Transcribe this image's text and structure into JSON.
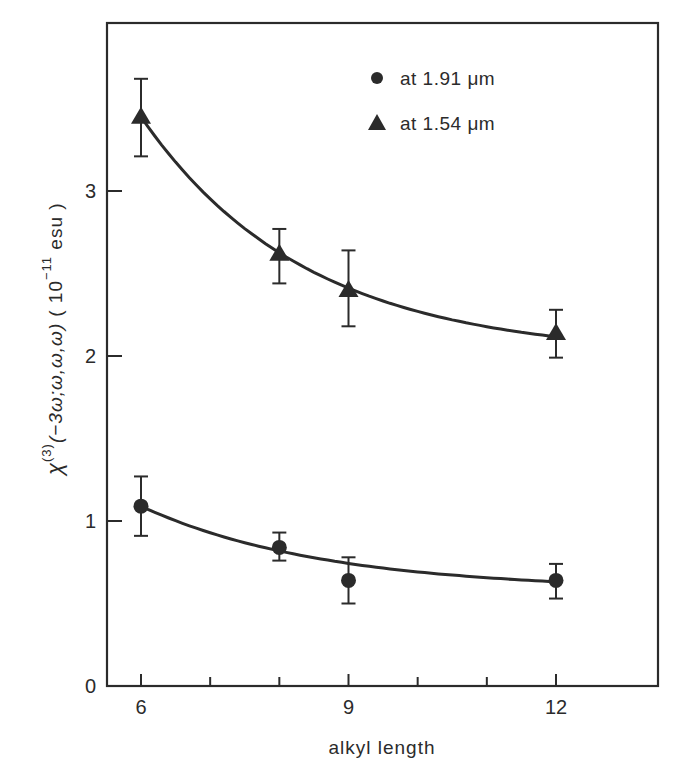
{
  "chart_data": {
    "type": "scatter",
    "title": "",
    "xlabel": "alkyl length",
    "ylabel": "χ(3)(−3ω;ω,ω,ω) (10⁻¹¹ esu)",
    "ylabel_parts": {
      "symbol": "χ",
      "superscript": "(3)",
      "arguments": "(−3ω;ω,ω,ω)",
      "unit_open": "( 10",
      "unit_exponent": "−11",
      "unit_close": " esu )"
    },
    "xlim": [
      5.5,
      13.5
    ],
    "ylim": [
      0,
      4.0
    ],
    "xticks": [
      6,
      7,
      8,
      9,
      10,
      11,
      12
    ],
    "xtick_labels": [
      "6",
      "",
      "",
      "9",
      "",
      "",
      "12"
    ],
    "yticks": [
      0,
      1,
      2,
      3
    ],
    "ytick_labels": [
      "0",
      "1",
      "2",
      "3"
    ],
    "grid": false,
    "legend_position": "upper right",
    "series": [
      {
        "name": "at 1.91 μm",
        "marker": "circle",
        "x": [
          6,
          8,
          9,
          12
        ],
        "y": [
          1.09,
          0.84,
          0.64,
          0.64
        ],
        "err_low": [
          0.91,
          0.76,
          0.5,
          0.53
        ],
        "err_high": [
          1.27,
          0.93,
          0.78,
          0.74
        ],
        "fit_curve": true
      },
      {
        "name": "at 1.54 μm",
        "marker": "triangle",
        "x": [
          6,
          8,
          9,
          12
        ],
        "y": [
          3.45,
          2.62,
          2.4,
          2.14
        ],
        "err_low": [
          3.21,
          2.44,
          2.18,
          1.99
        ],
        "err_high": [
          3.68,
          2.77,
          2.64,
          2.28
        ],
        "fit_curve": true
      }
    ]
  },
  "legend": {
    "items": [
      {
        "label": "at 1.91 μm",
        "marker": "circle"
      },
      {
        "label": "at 1.54 μm",
        "marker": "triangle"
      }
    ]
  },
  "colors": {
    "ink": "#2b2b2b",
    "background": "#ffffff"
  }
}
